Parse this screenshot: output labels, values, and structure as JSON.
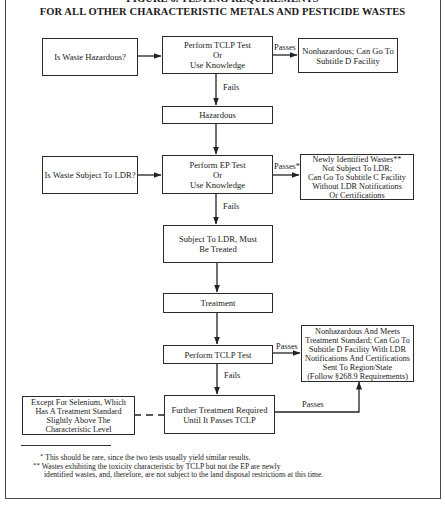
{
  "figure": {
    "title_line1": "FIGURE 6.  TESTING REQUIREMENTS",
    "title_line2": "FOR ALL OTHER CHARACTERISTIC METALS AND PESTICIDE WASTES"
  },
  "nodes": {
    "is_waste_hazardous": "Is Waste Hazardous?",
    "perform_tclp_or_knowledge": "Perform TCLP Test\nOr\nUse Knowledge",
    "nonhazardous_subtitle_d": "Nonhazardous; Can Go To\nSubtitle D Facility",
    "hazardous": "Hazardous",
    "is_waste_subject_to_ldr": "Is Waste Subject To LDR?",
    "perform_ep_or_knowledge": "Perform EP Test\nOr\nUse Knowledge",
    "newly_identified_wastes": "Newly Identified Wastes**\nNot Subject To LDR;\nCan Go To Subtitle C Facility\nWithout LDR Notifications\nOr Certifications",
    "subject_to_ldr_must_be_treated": "Subject To LDR, Must\nBe Treated",
    "treatment": "Treatment",
    "perform_tclp_test": "Perform TCLP Test",
    "nonhazardous_meets_standard": "Nonhazardous And Meets\nTreatment Standard; Can Go To\nSubtitle D Facility With LDR\nNotifications And Certifications\nSent To Region/State\n(Follow §268.9 Requirements)",
    "except_for_selenium": "Except For Selenium, Which\nHas A Treatment Standard\nSlightly Above The\nCharacteristic Level",
    "further_treatment_required": "Further Treatment Required\nUntil It Passes TCLP"
  },
  "edge_labels": {
    "passes_1": "Passes",
    "fails_1": "Fails",
    "passes_2": "Passes*",
    "fails_2": "Fails",
    "passes_3": "Passes",
    "fails_3": "Fails",
    "passes_4": "Passes"
  },
  "footnotes": {
    "note1_mark": "*",
    "note1": "This should be rare, since the two tests usually yield similar results.",
    "note2_mark": "**",
    "note2_line1": "Wastes exhibiting the toxicity characteristic by TCLP but not the EP are newly",
    "note2_line2": "identified wastes, and, therefore, are not subject to the land disposal restrictions at this time."
  }
}
